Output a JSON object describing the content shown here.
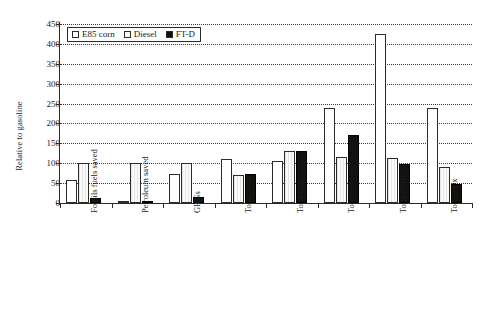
{
  "chart_data": {
    "type": "bar",
    "title": "",
    "xlabel": "",
    "ylabel": "Relative to gasoline",
    "ylim": [
      0,
      450
    ],
    "ytick_step": 50,
    "yticks": [
      450,
      400,
      350,
      300,
      250,
      200,
      150,
      100,
      50,
      0
    ],
    "grid": true,
    "legend_position": "top-left inside plot",
    "categories": [
      "Fossils fuels saved",
      "Petroleum saved",
      "GHGs",
      "Total VOC",
      "Total CO",
      "Total NOx",
      "Total PM10",
      "Total SOx"
    ],
    "series": [
      {
        "name": "E85 corn",
        "fill": "white",
        "color": "#ffffff",
        "values": [
          57,
          6,
          73,
          110,
          105,
          240,
          425,
          240
        ]
      },
      {
        "name": "Diesel",
        "fill": "light-hatched",
        "color": "#f2f2f2",
        "values": [
          100,
          100,
          100,
          70,
          130,
          115,
          112,
          90
        ]
      },
      {
        "name": "FT-D",
        "fill": "black",
        "color": "#111111",
        "values": [
          12,
          6,
          16,
          73,
          130,
          170,
          98,
          48
        ]
      }
    ]
  },
  "legend": {
    "items": [
      {
        "label": "E85 corn",
        "swatch": "white-square-icon"
      },
      {
        "label": "Diesel",
        "swatch": "light-square-icon"
      },
      {
        "label": "FT-D",
        "swatch": "black-square-icon"
      }
    ]
  }
}
